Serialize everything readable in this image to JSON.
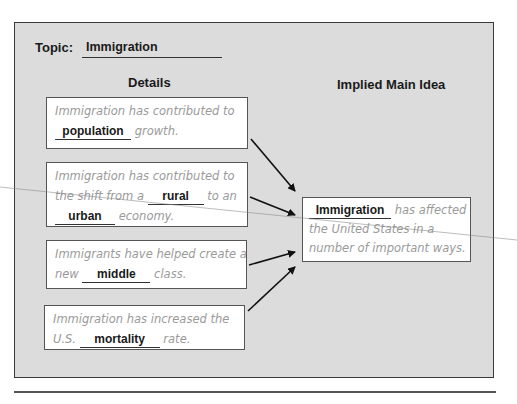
{
  "topic": {
    "label": "Topic:",
    "answer": "Immigration"
  },
  "headings": {
    "details": "Details",
    "main_idea": "Implied Main Idea"
  },
  "details": [
    {
      "lines": [
        {
          "pre": "Immigration has contributed to"
        },
        {
          "blank": "population",
          "post": " growth."
        }
      ]
    },
    {
      "lines": [
        {
          "pre": "Immigration has contributed to"
        },
        {
          "pre": "the shift from a ",
          "blank": "rural",
          "post": " to an"
        },
        {
          "blank": "urban",
          "post": " economy."
        }
      ]
    },
    {
      "lines": [
        {
          "pre": "Immigrants have helped create a"
        },
        {
          "pre": "new ",
          "blank": "middle",
          "post": " class."
        }
      ]
    },
    {
      "lines": [
        {
          "pre": "Immigration has increased the"
        },
        {
          "pre": "U.S. ",
          "blank": "mortality",
          "post": " rate."
        }
      ]
    }
  ],
  "main_idea": {
    "blank": "Immigration",
    "line1_post": " has affected",
    "line2": "the United States in a",
    "line3": "number of important ways."
  },
  "colors": {
    "panel": "#dcdcdc",
    "border": "#3a3a3a",
    "hint_text": "#9a9a9a",
    "answer_text": "#1a1a1a"
  }
}
